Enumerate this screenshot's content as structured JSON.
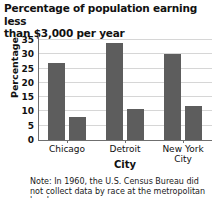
{
  "chart_data": {
    "type": "bar",
    "title": "Percentage of population earning less than $3,000 per year",
    "title_line1": "Percentage of population earning less",
    "title_line2": "than $3,000 per year",
    "xlabel": "City",
    "ylabel": "Percentage",
    "categories": [
      "Chicago",
      "Detroit",
      "New York City"
    ],
    "series": [
      {
        "name": "series-1",
        "values": [
          27,
          34,
          30
        ]
      },
      {
        "name": "series-2",
        "values": [
          8,
          11,
          12
        ]
      }
    ],
    "ylim": [
      0,
      35
    ],
    "yticks": [
      0,
      5,
      10,
      15,
      20,
      25,
      30,
      35
    ],
    "ytick_labels": [
      "0",
      "5",
      "10",
      "15",
      "20",
      "25",
      "30",
      "35"
    ],
    "grid": true,
    "legend": "none",
    "bar_color": "#5d5d5d",
    "grid_color": "#d6d6d6",
    "axis_color": "#6f6f6f",
    "note": "Note: In 1960, the U.S. Census Bureau did not collect data by race at the metropolitan level."
  },
  "category_labels": [
    {
      "line1": "Chicago",
      "line2": ""
    },
    {
      "line1": "Detroit",
      "line2": ""
    },
    {
      "line1": "New York",
      "line2": "City"
    }
  ]
}
